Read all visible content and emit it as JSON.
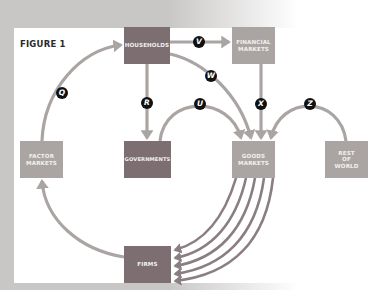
{
  "figure": {
    "title": "FIGURE 1"
  },
  "nodes": {
    "households": {
      "label": "HOUSEHOLDS"
    },
    "financial_markets": {
      "label": "FINANCIAL\nMARKETS"
    },
    "factor_markets": {
      "label": "FACTOR\nMARKETS"
    },
    "governments": {
      "label": "GOVERNMENTS"
    },
    "goods_markets": {
      "label": "GOODS\nMARKETS"
    },
    "rest_of_world": {
      "label": "REST\nOF\nWORLD"
    },
    "firms": {
      "label": "FIRMS"
    }
  },
  "flows": {
    "q": {
      "label": "Q",
      "from": "FACTOR MARKETS",
      "to": "HOUSEHOLDS"
    },
    "r": {
      "label": "R",
      "from": "HOUSEHOLDS",
      "to": "GOVERNMENTS"
    },
    "v": {
      "label": "V",
      "from": "HOUSEHOLDS",
      "to": "FINANCIAL MARKETS"
    },
    "w": {
      "label": "W",
      "from": "HOUSEHOLDS",
      "to": "GOODS MARKETS"
    },
    "u": {
      "label": "U",
      "from": "GOVERNMENTS",
      "to": "GOODS MARKETS"
    },
    "x": {
      "label": "X",
      "from": "FINANCIAL MARKETS",
      "to": "GOODS MARKETS"
    },
    "z": {
      "label": "Z",
      "from": "REST OF WORLD",
      "to": "GOODS MARKETS"
    },
    "firms_to_factor": {
      "from": "FIRMS",
      "to": "FACTOR MARKETS"
    },
    "goods_to_firms": {
      "from": "GOODS MARKETS",
      "to": "FIRMS",
      "count": 5
    }
  },
  "colors": {
    "dark_box": "#7d6e72",
    "light_box": "#aaa5a3",
    "arrow": "#aaa5a3",
    "arrow_dark": "#8a7e82",
    "badge": "#111111",
    "background": "#c9c7c6"
  }
}
